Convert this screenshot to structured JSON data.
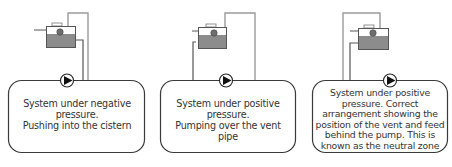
{
  "colors": {
    "outline": "#3a3a3a",
    "pipe": "#9a9a9a",
    "tank_fill": "#ffffff",
    "water": "#8c8c8c",
    "pump_fill": "#ffffff",
    "pump_arrow": "#111111"
  },
  "panels": [
    {
      "caption_lines": [
        "System under negative",
        "pressure.",
        "Pushing into the cistern"
      ]
    },
    {
      "caption_lines": [
        "System under positive",
        "pressure.",
        "Pumping over the vent",
        "pipe"
      ]
    },
    {
      "caption_lines": [
        "System under positive",
        "pressure. Correct",
        "arrangement showing the",
        "position of the vent and feed",
        "behind the pump. This is",
        "known as the neutral zone"
      ]
    }
  ]
}
